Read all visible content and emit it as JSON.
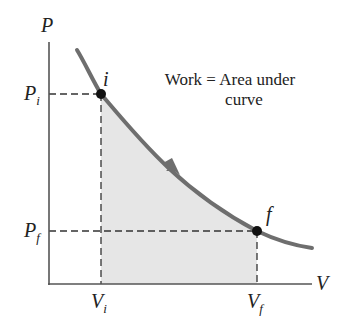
{
  "diagram": {
    "axes": {
      "y_label": "P",
      "x_label": "V"
    },
    "points": [
      {
        "name": "i",
        "label": "i",
        "pressure_label": "P",
        "pressure_sub": "i",
        "volume_label": "V",
        "volume_sub": "i"
      },
      {
        "name": "f",
        "label": "f",
        "pressure_label": "P",
        "pressure_sub": "f",
        "volume_label": "V",
        "volume_sub": "f"
      }
    ],
    "annotation": {
      "line1": "Work = Area under",
      "line2": "curve"
    },
    "colors": {
      "curve": "#6e6e6e",
      "axes": "#555555",
      "shade": "#e4e4e4",
      "dashes": "#333333",
      "points": "#111111"
    }
  }
}
